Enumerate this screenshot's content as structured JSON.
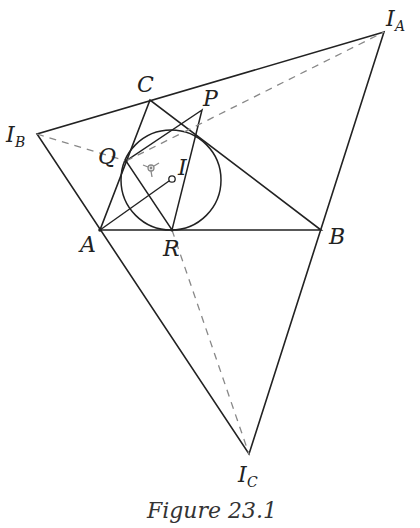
{
  "figure": {
    "caption": "Figure 23.1",
    "points": {
      "A": {
        "label": "A",
        "x": 100,
        "y": 230
      },
      "B": {
        "label": "B",
        "x": 321,
        "y": 230
      },
      "C": {
        "label": "C",
        "x": 150,
        "y": 100
      },
      "P": {
        "label": "P",
        "x": 202,
        "y": 110
      },
      "Q": {
        "label": "Q",
        "x": 126,
        "y": 161
      },
      "R": {
        "label": "R",
        "x": 172,
        "y": 230
      },
      "I": {
        "label": "I",
        "x": 172,
        "y": 179
      },
      "IA": {
        "label": "I",
        "sub": "A",
        "x": 384,
        "y": 32
      },
      "IB": {
        "label": "I",
        "sub": "B",
        "x": 37,
        "y": 134
      },
      "IC": {
        "label": "I",
        "sub": "C",
        "x": 249,
        "y": 454
      }
    },
    "incircle": {
      "cx": 171,
      "cy": 180,
      "r": 50
    },
    "solid_segments": [
      "IA-IB",
      "IB-IC",
      "IC-IA",
      "A-B",
      "B-C",
      "C-A",
      "P-Q",
      "Q-R",
      "R-P",
      "A-I"
    ],
    "dashed_segments": [
      "IB-Q",
      "Q-IA",
      "R-IC"
    ],
    "line_color": "#222222",
    "dash_color": "#888888"
  }
}
